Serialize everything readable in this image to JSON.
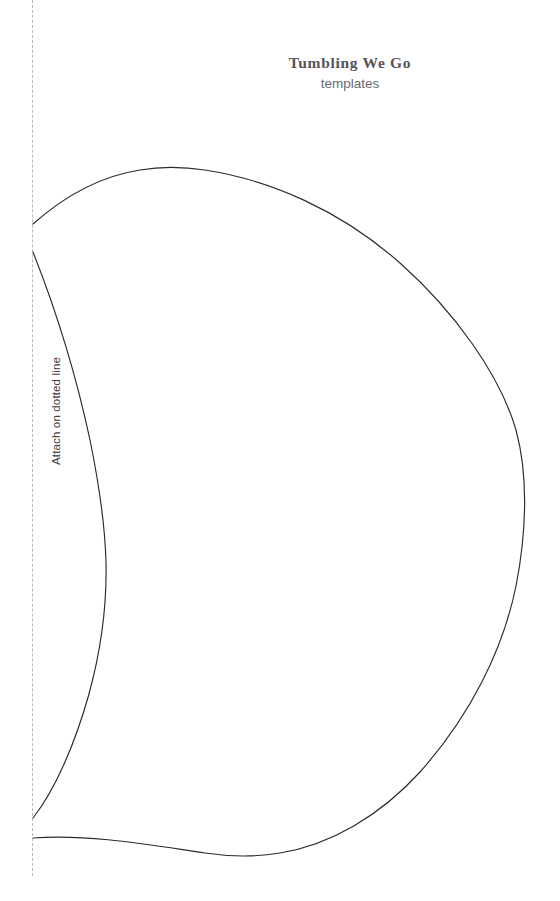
{
  "page": {
    "width": 560,
    "height": 901,
    "background_color": "#ffffff",
    "kind": "printable-template-sheet"
  },
  "header": {
    "title": "Tumbling We Go",
    "subtitle": "templates",
    "title_color": "#555458",
    "subtitle_color": "#6a6a6e"
  },
  "fold_line": {
    "label": "Attach on dotted line",
    "style": "dashed",
    "color": "#b9b9bd",
    "orientation": "vertical",
    "x": 32,
    "y_start": 0,
    "y_end": 876
  },
  "template_shape": {
    "name": "leaf-body-outline",
    "stroke_color": "#2b2b2e",
    "stroke_width": 1.15,
    "fill": "none",
    "description": "Large teardrop/leaf outline opening at the dotted fold line, plus an inner curved edge",
    "outer_curve": {
      "start": [
        33,
        224
      ],
      "end": [
        33,
        838
      ],
      "top_apex": [
        185,
        167
      ],
      "right_extent": [
        525,
        450
      ],
      "bottom_apex": [
        210,
        855
      ]
    },
    "inner_curve": {
      "start": [
        33,
        252
      ],
      "end": [
        33,
        818
      ],
      "right_extent": [
        106,
        560
      ]
    }
  }
}
